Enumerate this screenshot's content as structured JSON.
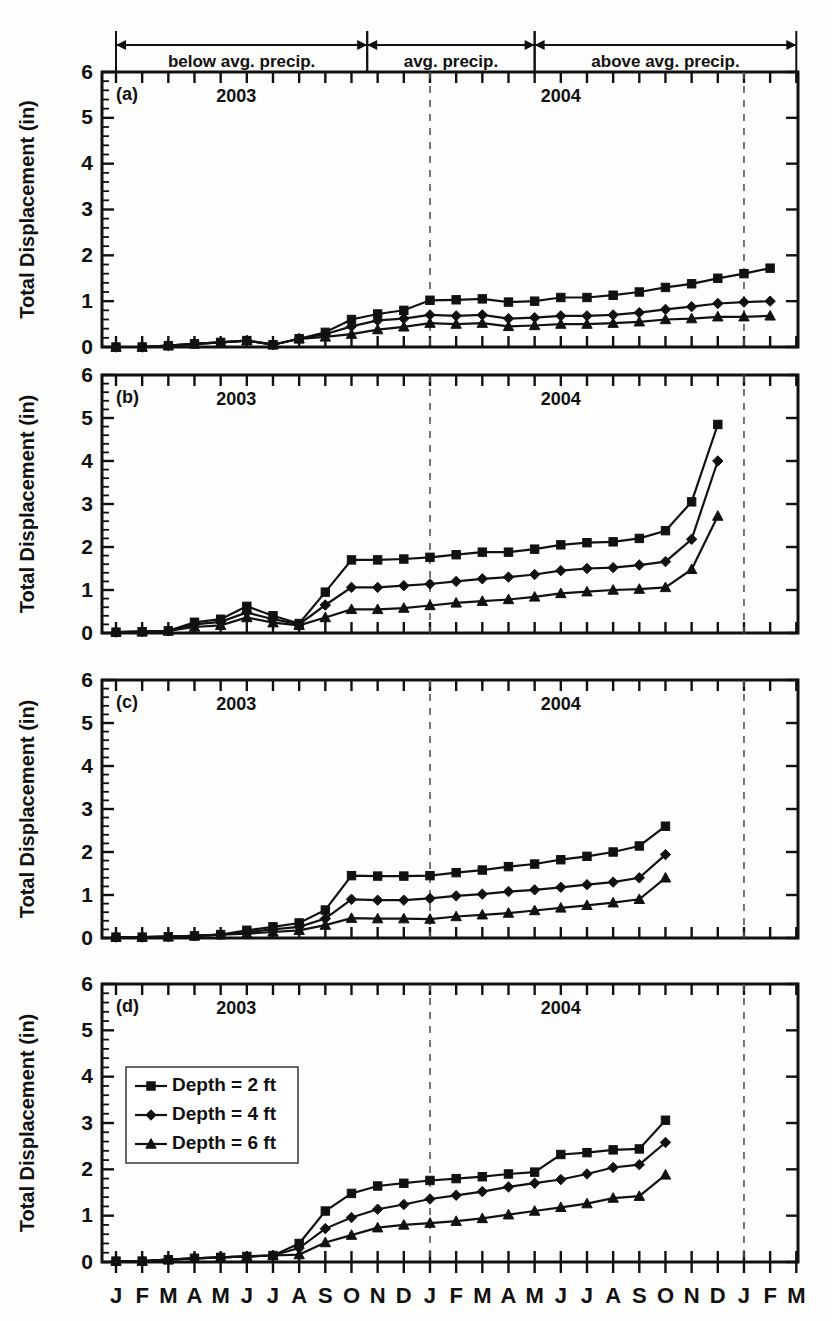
{
  "figure": {
    "width": 832,
    "height": 1321,
    "ylabel": "Total Displacement (in)",
    "yticks": [
      "0",
      "1",
      "2",
      "3",
      "4",
      "5",
      "6"
    ],
    "month_labels": [
      "J",
      "F",
      "M",
      "A",
      "M",
      "J",
      "J",
      "A",
      "S",
      "O",
      "N",
      "D",
      "J",
      "F",
      "M",
      "A",
      "M",
      "J",
      "J",
      "A",
      "S",
      "O",
      "N",
      "D",
      "J",
      "F",
      "M"
    ],
    "year_labels": [
      "2003",
      "2004"
    ],
    "panel_tags": [
      "(a)",
      "(b)",
      "(c)",
      "(d)"
    ],
    "precip_bands": [
      {
        "label": "below avg. precip.",
        "start_month": 0,
        "end_month": 9.6
      },
      {
        "label": "avg. precip.",
        "start_month": 9.6,
        "end_month": 16.0
      },
      {
        "label": "above avg. precip.",
        "start_month": 16.0,
        "end_month": 26.0
      }
    ],
    "legend": {
      "items": [
        {
          "label": "Depth = 2 ft",
          "marker": "square"
        },
        {
          "label": "Depth = 4 ft",
          "marker": "diamond"
        },
        {
          "label": "Depth = 6 ft",
          "marker": "triangle"
        }
      ]
    },
    "year_divider_months": [
      12,
      24
    ]
  },
  "chart_data": {
    "type": "line",
    "title": "",
    "xlabel": "",
    "ylabel": "Total Displacement (in)",
    "ylim": [
      0,
      6
    ],
    "grid": false,
    "legend_position": "inside lower-left of panel (d)",
    "x": [
      "J",
      "F",
      "M",
      "A",
      "M",
      "J",
      "J",
      "A",
      "S",
      "O",
      "N",
      "D",
      "J",
      "F",
      "M",
      "A",
      "M",
      "J",
      "J",
      "A",
      "S",
      "O",
      "N",
      "D",
      "J",
      "F",
      "M"
    ],
    "x_years": [
      "2003",
      "2003",
      "2003",
      "2003",
      "2003",
      "2003",
      "2003",
      "2003",
      "2003",
      "2003",
      "2003",
      "2003",
      "2004",
      "2004",
      "2004",
      "2004",
      "2004",
      "2004",
      "2004",
      "2004",
      "2004",
      "2004",
      "2004",
      "2004",
      "2005",
      "2005",
      "2005"
    ],
    "panels": [
      {
        "tag": "(a)",
        "series": [
          {
            "name": "Depth = 2 ft",
            "marker": "square",
            "values": [
              0.0,
              0.0,
              0.03,
              0.07,
              0.1,
              0.14,
              0.05,
              0.18,
              0.32,
              0.6,
              0.72,
              0.8,
              1.02,
              1.03,
              1.05,
              0.98,
              1.0,
              1.08,
              1.08,
              1.13,
              1.2,
              1.3,
              1.38,
              1.5,
              1.6,
              1.72,
              null
            ]
          },
          {
            "name": "Depth = 4 ft",
            "marker": "diamond",
            "values": [
              0.0,
              0.0,
              0.03,
              0.07,
              0.1,
              0.14,
              0.05,
              0.18,
              0.28,
              0.45,
              0.58,
              0.62,
              0.7,
              0.68,
              0.7,
              0.62,
              0.64,
              0.68,
              0.68,
              0.7,
              0.75,
              0.82,
              0.88,
              0.95,
              0.98,
              1.0,
              null
            ]
          },
          {
            "name": "Depth = 6 ft",
            "marker": "triangle",
            "values": [
              0.0,
              0.0,
              0.03,
              0.07,
              0.1,
              0.14,
              0.05,
              0.18,
              0.22,
              0.28,
              0.38,
              0.44,
              0.52,
              0.5,
              0.52,
              0.45,
              0.47,
              0.5,
              0.5,
              0.52,
              0.55,
              0.6,
              0.62,
              0.66,
              0.66,
              0.68,
              null
            ]
          }
        ]
      },
      {
        "tag": "(b)",
        "series": [
          {
            "name": "Depth = 2 ft",
            "marker": "square",
            "values": [
              0.02,
              0.03,
              0.05,
              0.25,
              0.32,
              0.62,
              0.4,
              0.22,
              0.95,
              1.7,
              1.7,
              1.72,
              1.76,
              1.82,
              1.88,
              1.88,
              1.95,
              2.05,
              2.1,
              2.12,
              2.2,
              2.38,
              3.05,
              4.85,
              null,
              null,
              null
            ]
          },
          {
            "name": "Depth = 4 ft",
            "marker": "diamond",
            "values": [
              0.02,
              0.03,
              0.05,
              0.2,
              0.26,
              0.48,
              0.32,
              0.2,
              0.65,
              1.06,
              1.06,
              1.1,
              1.14,
              1.2,
              1.26,
              1.3,
              1.36,
              1.45,
              1.5,
              1.52,
              1.58,
              1.66,
              2.18,
              4.0,
              null,
              null,
              null
            ]
          },
          {
            "name": "Depth = 6 ft",
            "marker": "triangle",
            "values": [
              0.02,
              0.03,
              0.05,
              0.14,
              0.18,
              0.36,
              0.24,
              0.18,
              0.36,
              0.55,
              0.55,
              0.58,
              0.64,
              0.7,
              0.74,
              0.78,
              0.84,
              0.92,
              0.96,
              1.0,
              1.02,
              1.06,
              1.48,
              2.72,
              null,
              null,
              null
            ]
          }
        ]
      },
      {
        "tag": "(c)",
        "series": [
          {
            "name": "Depth = 2 ft",
            "marker": "square",
            "values": [
              0.02,
              0.02,
              0.03,
              0.05,
              0.08,
              0.18,
              0.26,
              0.35,
              0.65,
              1.45,
              1.44,
              1.44,
              1.45,
              1.52,
              1.58,
              1.66,
              1.72,
              1.82,
              1.9,
              2.0,
              2.14,
              2.6,
              null,
              null,
              null,
              null,
              null
            ]
          },
          {
            "name": "Depth = 4 ft",
            "marker": "diamond",
            "values": [
              0.02,
              0.02,
              0.03,
              0.05,
              0.08,
              0.14,
              0.2,
              0.26,
              0.45,
              0.9,
              0.88,
              0.88,
              0.92,
              0.98,
              1.02,
              1.08,
              1.12,
              1.18,
              1.24,
              1.3,
              1.4,
              1.94,
              null,
              null,
              null,
              null,
              null
            ]
          },
          {
            "name": "Depth = 6 ft",
            "marker": "triangle",
            "values": [
              0.02,
              0.02,
              0.03,
              0.05,
              0.08,
              0.1,
              0.14,
              0.18,
              0.3,
              0.46,
              0.45,
              0.45,
              0.44,
              0.5,
              0.54,
              0.58,
              0.64,
              0.7,
              0.76,
              0.82,
              0.9,
              1.4,
              null,
              null,
              null,
              null,
              null
            ]
          }
        ]
      },
      {
        "tag": "(d)",
        "series": [
          {
            "name": "Depth = 2 ft",
            "marker": "square",
            "values": [
              0.02,
              0.02,
              0.05,
              0.08,
              0.1,
              0.12,
              0.14,
              0.4,
              1.1,
              1.48,
              1.64,
              1.7,
              1.76,
              1.8,
              1.84,
              1.9,
              1.94,
              2.32,
              2.36,
              2.42,
              2.44,
              3.06,
              null,
              null,
              null,
              null,
              null
            ]
          },
          {
            "name": "Depth = 4 ft",
            "marker": "diamond",
            "values": [
              0.02,
              0.02,
              0.05,
              0.08,
              0.1,
              0.12,
              0.14,
              0.3,
              0.72,
              0.96,
              1.14,
              1.24,
              1.36,
              1.44,
              1.52,
              1.62,
              1.7,
              1.78,
              1.9,
              2.04,
              2.1,
              2.58,
              null,
              null,
              null,
              null,
              null
            ]
          },
          {
            "name": "Depth = 6 ft",
            "marker": "triangle",
            "values": [
              0.02,
              0.02,
              0.05,
              0.08,
              0.1,
              0.12,
              0.14,
              0.16,
              0.42,
              0.58,
              0.74,
              0.8,
              0.84,
              0.88,
              0.94,
              1.02,
              1.1,
              1.18,
              1.26,
              1.38,
              1.42,
              1.88,
              null,
              null,
              null,
              null,
              null
            ]
          }
        ]
      }
    ]
  }
}
